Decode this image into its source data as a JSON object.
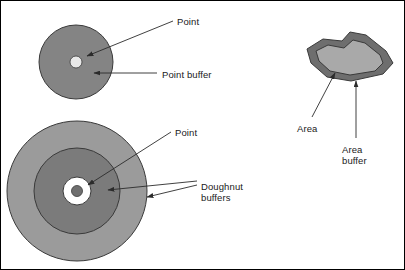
{
  "figure": {
    "width": 405,
    "height": 270,
    "background": "#ffffff",
    "border_color": "#000000"
  },
  "colors": {
    "point_buffer_fill": "#848484",
    "point_fill": "#e8e8e8",
    "outer_doughnut_fill": "#9b9b9b",
    "inner_doughnut_fill": "#7b7b7b",
    "doughnut_hole_fill": "#ffffff",
    "doughnut_point_fill": "#6f6f6f",
    "area_buffer_fill": "#6e6e6e",
    "area_fill": "#a9a9a9",
    "outline": "#3a3a3a",
    "leader_line": "#2b2b2b",
    "text": "#1a1a1a"
  },
  "shapes": {
    "point_buffer_circle": {
      "name": "point-buffer",
      "cx": 75,
      "cy": 61,
      "r": 37
    },
    "point_marker_small": {
      "name": "point",
      "cx": 75,
      "cy": 61,
      "r": 6
    },
    "doughnut_outer": {
      "name": "outer-doughnut-buffer",
      "cx": 76,
      "cy": 190,
      "r": 70
    },
    "doughnut_inner": {
      "name": "inner-doughnut-buffer",
      "cx": 76,
      "cy": 190,
      "r": 43
    },
    "doughnut_hole": {
      "name": "doughnut-hole",
      "cx": 76,
      "cy": 190,
      "r": 14
    },
    "doughnut_point": {
      "name": "point",
      "cx": 76,
      "cy": 190,
      "r": 5.5
    },
    "area_buffer_polygon": {
      "name": "area-buffer",
      "points": "310,62 306,48 322,38 341,40 349,31 365,34 385,50 392,62 382,73 350,80 326,76"
    },
    "area_polygon": {
      "name": "area",
      "points": "318,60 315,50 327,44 343,47 352,39 364,42 379,54 382,62 374,70 349,74 329,70"
    }
  },
  "labels": {
    "point_top": {
      "text": "Point",
      "x": 176,
      "y": 15
    },
    "point_buffer": {
      "text": "Point buffer",
      "x": 161,
      "y": 68
    },
    "point_bottom": {
      "text": "Point",
      "x": 174,
      "y": 126
    },
    "doughnut_buffers_line1": {
      "text": "Doughnut",
      "x": 200,
      "y": 180
    },
    "doughnut_buffers_line2": {
      "text": "buffers",
      "x": 200,
      "y": 191
    },
    "area": {
      "text": "Area",
      "x": 296,
      "y": 122
    },
    "area_buffer_line1": {
      "text": "Area",
      "x": 341,
      "y": 143
    },
    "area_buffer_line2": {
      "text": "buffer",
      "x": 341,
      "y": 154
    }
  },
  "leaders": {
    "point_top": {
      "name": "leader-point-top",
      "path": "M 172,20 L 86,55"
    },
    "point_buffer": {
      "name": "leader-point-buffer",
      "path": "M 156,72 L 93,72"
    },
    "point_bottom": {
      "name": "leader-point-bottom",
      "path": "M 170,131 L 87,184"
    },
    "doughnut_outer": {
      "name": "leader-doughnut-outer",
      "path": "M 196,184 L 146,196"
    },
    "doughnut_inner": {
      "name": "leader-doughnut-inner",
      "path": "M 196,180 L 107,189"
    },
    "area": {
      "name": "leader-area",
      "path": "M 311,116 L 334,72"
    },
    "area_buffer": {
      "name": "leader-area-buffer",
      "path": "M 355,137 L 355,80"
    }
  }
}
